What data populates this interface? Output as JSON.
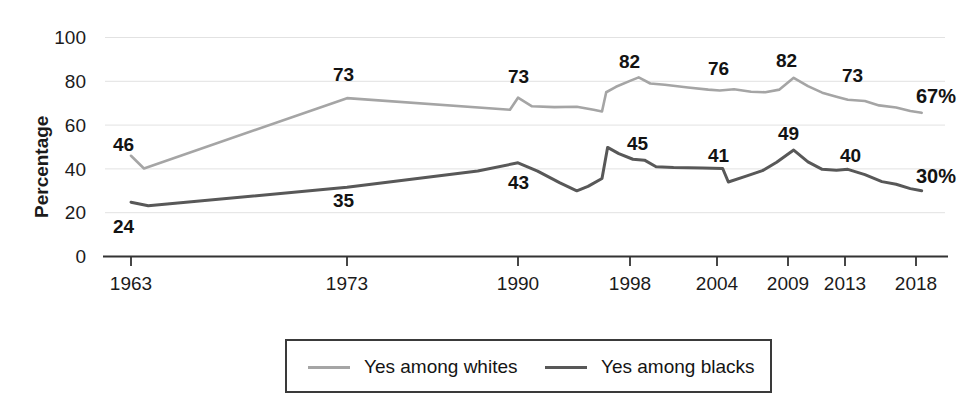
{
  "chart_data": {
    "type": "line",
    "title": "",
    "xlabel": "",
    "ylabel": "Percentage",
    "ylim": [
      0,
      100
    ],
    "yticks": [
      0,
      20,
      40,
      60,
      80,
      100
    ],
    "xticks": [
      "1963",
      "1973",
      "1990",
      "1998",
      "2004",
      "2009",
      "2013",
      "2018"
    ],
    "grid": "horizontal",
    "legend_position": "bottom",
    "series": [
      {
        "name": "Yes among whites",
        "color": "#a5a5a5",
        "end_label": "67%",
        "annotations": [
          {
            "x": "1963",
            "value": 46,
            "label": "46"
          },
          {
            "x": "1973",
            "value": 73,
            "label": "73"
          },
          {
            "x": "1990",
            "value": 73,
            "label": "73"
          },
          {
            "x": "1998",
            "value": 82,
            "label": "82"
          },
          {
            "x": "2004",
            "value": 76,
            "label": "76"
          },
          {
            "x": "2009",
            "value": 82,
            "label": "82"
          },
          {
            "x": "2013",
            "value": 73,
            "label": "73"
          },
          {
            "x": "2018",
            "value": 67,
            "label": "67%"
          }
        ],
        "points": [
          [
            1963,
            46
          ],
          [
            1963.6,
            40.2
          ],
          [
            1973,
            72.3
          ],
          [
            1989.2,
            67.0
          ],
          [
            1990,
            72.5
          ],
          [
            1991,
            68.6
          ],
          [
            1992.6,
            68.2
          ],
          [
            1994.2,
            68.4
          ],
          [
            1995.4,
            67.0
          ],
          [
            1996.0,
            66.2
          ],
          [
            1996.3,
            75.0
          ],
          [
            1997.0,
            77.5
          ],
          [
            1998.0,
            80.2
          ],
          [
            1998.6,
            81.8
          ],
          [
            1999.4,
            79.0
          ],
          [
            2000.4,
            78.4
          ],
          [
            2002.0,
            77.2
          ],
          [
            2003.4,
            76.2
          ],
          [
            2004.2,
            75.8
          ],
          [
            2005.2,
            76.4
          ],
          [
            2006.4,
            75.2
          ],
          [
            2007.4,
            75.0
          ],
          [
            2008.4,
            76.2
          ],
          [
            2009.4,
            81.6
          ],
          [
            2010.4,
            77.8
          ],
          [
            2011.4,
            74.8
          ],
          [
            2012.4,
            73.0
          ],
          [
            2013.2,
            71.6
          ],
          [
            2014.4,
            71.0
          ],
          [
            2015.4,
            69.0
          ],
          [
            2016.6,
            68.0
          ],
          [
            2017.6,
            66.4
          ],
          [
            2018.4,
            65.6
          ]
        ]
      },
      {
        "name": "Yes among blacks",
        "color": "#585858",
        "end_label": "30%",
        "annotations": [
          {
            "x": "1963",
            "value": 24,
            "label": "24"
          },
          {
            "x": "1973",
            "value": 35,
            "label": "35"
          },
          {
            "x": "1990",
            "value": 43,
            "label": "43"
          },
          {
            "x": "1998",
            "value": 45,
            "label": "45"
          },
          {
            "x": "2004",
            "value": 41,
            "label": "41"
          },
          {
            "x": "2009",
            "value": 49,
            "label": "49"
          },
          {
            "x": "2013",
            "value": 40,
            "label": "40"
          },
          {
            "x": "2018",
            "value": 30,
            "label": "30%"
          }
        ],
        "points": [
          [
            1963,
            24.8
          ],
          [
            1963.8,
            23.2
          ],
          [
            1973,
            31.6
          ],
          [
            1986.0,
            39.0
          ],
          [
            1990.0,
            42.8
          ],
          [
            1991.4,
            39.0
          ],
          [
            1993.0,
            33.6
          ],
          [
            1994.2,
            30.0
          ],
          [
            1995.0,
            32.0
          ],
          [
            1996.0,
            35.6
          ],
          [
            1996.4,
            49.8
          ],
          [
            1997.2,
            47.0
          ],
          [
            1998.2,
            44.4
          ],
          [
            1999.0,
            44.0
          ],
          [
            1999.8,
            41.0
          ],
          [
            2001.0,
            40.6
          ],
          [
            2003.0,
            40.4
          ],
          [
            2004.4,
            40.2
          ],
          [
            2004.8,
            34.0
          ],
          [
            2006.0,
            36.6
          ],
          [
            2007.2,
            39.2
          ],
          [
            2008.2,
            43.0
          ],
          [
            2009.4,
            48.6
          ],
          [
            2010.4,
            43.2
          ],
          [
            2011.4,
            39.8
          ],
          [
            2012.4,
            39.4
          ],
          [
            2013.2,
            39.8
          ],
          [
            2014.4,
            37.4
          ],
          [
            2015.6,
            34.2
          ],
          [
            2016.6,
            33.0
          ],
          [
            2017.6,
            31.0
          ],
          [
            2018.4,
            30.0
          ]
        ]
      }
    ]
  },
  "axis": {
    "ylabel": "Percentage",
    "yticks": [
      "100",
      "80",
      "60",
      "40",
      "20",
      "0"
    ],
    "xticks": [
      "1963",
      "1973",
      "1990",
      "1998",
      "2004",
      "2009",
      "2013",
      "2018"
    ]
  },
  "legend": {
    "items": [
      {
        "label": "Yes among whites",
        "color": "#a5a5a5"
      },
      {
        "label": "Yes among blacks",
        "color": "#585858"
      }
    ]
  },
  "annotations": {
    "whites": {
      "a1963": "46",
      "a1973": "73",
      "a1990": "73",
      "a1998": "82",
      "a2004": "76",
      "a2009": "82",
      "a2013": "73",
      "end": "67%"
    },
    "blacks": {
      "a1963": "24",
      "a1973": "35",
      "a1990": "43",
      "a1998": "45",
      "a2004": "41",
      "a2009": "49",
      "a2013": "40",
      "end": "30%"
    }
  }
}
